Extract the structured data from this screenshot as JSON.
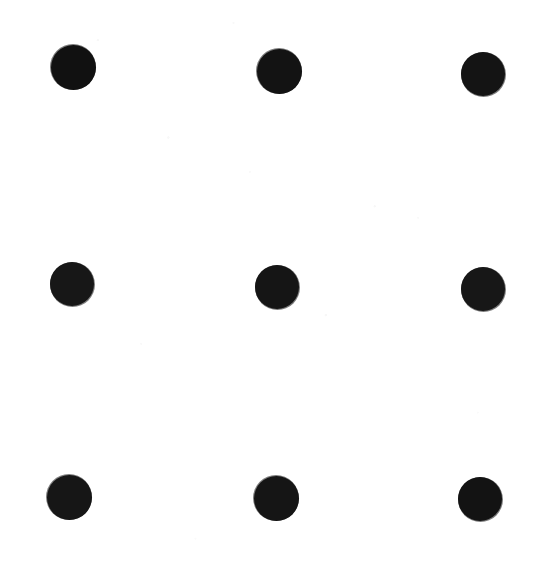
{
  "image": {
    "title": "Nine Dots Puzzle",
    "description": "Three-by-three square array of nine solid black dots on a plain white background",
    "width": 543,
    "height": 573,
    "background_color": "#ffffff",
    "has_caption": false,
    "has_border": false,
    "caption": ""
  },
  "figure": {
    "dot_color": "#111111",
    "dot_count": 9,
    "rows": 3,
    "columns": 3,
    "row_labels": [
      "top",
      "middle",
      "bottom"
    ],
    "column_labels": [
      "left",
      "center",
      "right"
    ]
  },
  "dots": [
    {
      "id": "dot-top-left",
      "row": 0,
      "col": 0,
      "cx": 73,
      "cy": 67,
      "d": 45,
      "color": "#111111"
    },
    {
      "id": "dot-top-center",
      "row": 0,
      "col": 1,
      "cx": 279,
      "cy": 71,
      "d": 45,
      "color": "#131313"
    },
    {
      "id": "dot-top-right",
      "row": 0,
      "col": 2,
      "cx": 483,
      "cy": 74,
      "d": 44,
      "color": "#141414"
    },
    {
      "id": "dot-middle-left",
      "row": 1,
      "col": 0,
      "cx": 72,
      "cy": 284,
      "d": 44,
      "color": "#171717"
    },
    {
      "id": "dot-middle-center",
      "row": 1,
      "col": 1,
      "cx": 277,
      "cy": 287,
      "d": 44,
      "color": "#151515"
    },
    {
      "id": "dot-middle-right",
      "row": 1,
      "col": 2,
      "cx": 483,
      "cy": 289,
      "d": 44,
      "color": "#171717"
    },
    {
      "id": "dot-bottom-left",
      "row": 2,
      "col": 0,
      "cx": 69,
      "cy": 497,
      "d": 45,
      "color": "#161616"
    },
    {
      "id": "dot-bottom-center",
      "row": 2,
      "col": 1,
      "cx": 276,
      "cy": 498,
      "d": 45,
      "color": "#151515"
    },
    {
      "id": "dot-bottom-right",
      "row": 2,
      "col": 2,
      "cx": 480,
      "cy": 499,
      "d": 44,
      "color": "#131313"
    }
  ]
}
